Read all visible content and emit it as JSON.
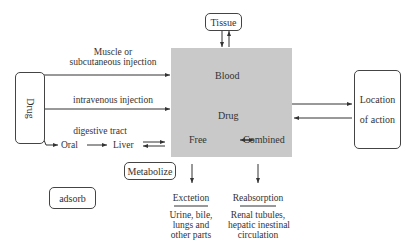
{
  "diagram": {
    "nodes": {
      "tissue": "Tissue",
      "drug_source": "Drug",
      "location": [
        "Location",
        "of action"
      ],
      "metabolize": "Metabolize",
      "adsorb": "adsorb"
    },
    "central": {
      "blood": "Blood",
      "drug": "Drug",
      "free": "Free",
      "combined": "Combined",
      "fill_color": "#c9c9c9"
    },
    "routes": {
      "muscle": [
        "Muscle or",
        "subcutaneous injection"
      ],
      "iv": "intravenous injection",
      "digestive": "digestive tract",
      "oral": "Oral",
      "liver": "Liver"
    },
    "outputs": {
      "excretion_title": "Exctetion",
      "excretion_detail": [
        "Urine, bile,",
        "lungs and",
        "other parts"
      ],
      "reabsorption_title": "Reabsorption",
      "reabsorption_detail": [
        "Renal tubules,",
        "hepatic inestinal",
        "circulation"
      ]
    }
  }
}
